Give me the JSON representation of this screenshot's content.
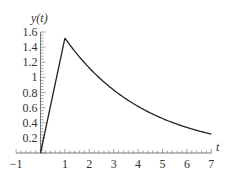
{
  "chart_data": {
    "type": "line",
    "title": "",
    "xlabel": "t",
    "ylabel": "y(t)",
    "xlim": [
      -1,
      7
    ],
    "ylim": [
      0,
      1.6
    ],
    "x_ticks": [
      "-1",
      "1",
      "2",
      "3",
      "4",
      "5",
      "6",
      "7"
    ],
    "y_ticks": [
      "0.2",
      "0.4",
      "0.6",
      "0.8",
      "1",
      "1.2",
      "1.4",
      "1.6"
    ],
    "grid": false,
    "legend": null,
    "series": [
      {
        "name": "y(t)",
        "color": "#222222",
        "x": [
          0,
          1,
          1.5,
          2,
          2.5,
          3,
          3.5,
          4,
          4.5,
          5,
          5.5,
          6,
          6.5,
          7
        ],
        "values": [
          0,
          1.52,
          1.31,
          1.13,
          0.97,
          0.84,
          0.72,
          0.62,
          0.54,
          0.46,
          0.4,
          0.34,
          0.3,
          0.25
        ]
      }
    ]
  }
}
